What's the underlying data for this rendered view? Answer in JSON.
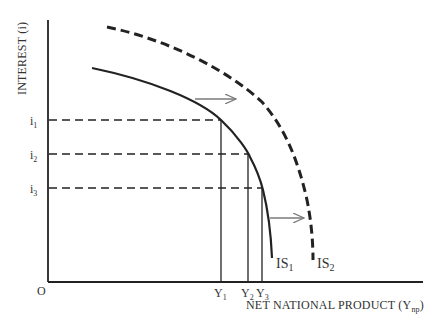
{
  "diagram": {
    "type": "economics-is-curve-shift",
    "y_axis_label": "INTEREST (i)",
    "x_axis_label_main": "NET NATIONAL PRODUCT (Y",
    "x_axis_label_sub": "np",
    "x_axis_label_close": ")",
    "origin_label": "O",
    "interest_levels": [
      {
        "base": "i",
        "sub": "1"
      },
      {
        "base": "i",
        "sub": "2"
      },
      {
        "base": "i",
        "sub": "3"
      }
    ],
    "output_levels": [
      {
        "base": "Y",
        "sub": "1"
      },
      {
        "base": "Y",
        "sub": "2"
      },
      {
        "base": "Y",
        "sub": "3"
      }
    ],
    "curves": [
      {
        "name": "IS",
        "sub": "1",
        "style": "solid"
      },
      {
        "name": "IS",
        "sub": "2",
        "style": "dashed"
      }
    ],
    "arrows": [
      {
        "description": "upper shift arrow from IS1 toward IS2"
      },
      {
        "description": "lower shift arrow from IS1 toward IS2"
      }
    ],
    "colors": {
      "line": "#222222",
      "arrow": "#7a7a7a",
      "text": "#333333",
      "background": "#ffffff"
    }
  }
}
